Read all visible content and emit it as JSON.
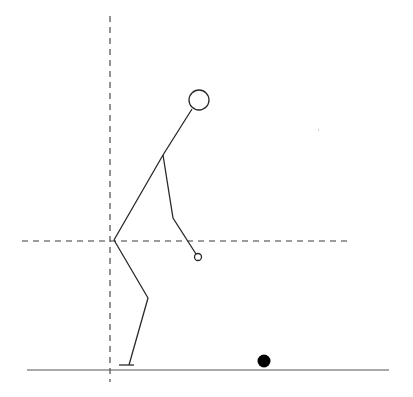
{
  "diagram": {
    "canvas": {
      "width": 413,
      "height": 397,
      "background": "#ffffff"
    },
    "colors": {
      "line": "#2a2a2a",
      "dashed": "#3a3a3a",
      "ground": "#555555",
      "ball": "#000000"
    },
    "reference_lines": {
      "vertical": {
        "x": 110,
        "y1": 16,
        "y2": 382
      },
      "horizontal": {
        "y": 241,
        "x1": 22,
        "x2": 351
      }
    },
    "ground": {
      "y": 370,
      "x1": 27,
      "x2": 389
    },
    "figure": {
      "head": {
        "cx": 199,
        "cy": 100,
        "r": 10
      },
      "neck": {
        "x": 192,
        "y": 109
      },
      "shoulder": {
        "x": 163,
        "y": 155
      },
      "hip": {
        "x": 114,
        "y": 240
      },
      "elbow": {
        "x": 173,
        "y": 218
      },
      "hand": {
        "cx": 198,
        "cy": 257,
        "r": 3.5
      },
      "knee": {
        "x": 148,
        "y": 298
      },
      "ankle": {
        "x": 129,
        "y": 365
      },
      "foot": {
        "x1": 119,
        "x2": 134,
        "y": 365
      }
    },
    "ball": {
      "cx": 264,
      "cy": 361,
      "r": 6.5
    },
    "speck": {
      "x": 318,
      "y": 129
    }
  }
}
